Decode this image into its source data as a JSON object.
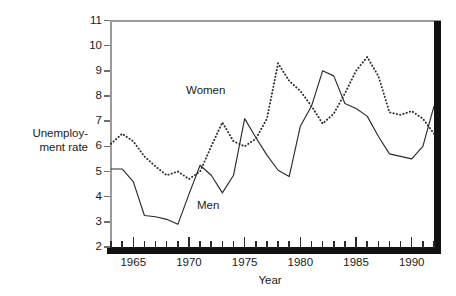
{
  "chart_data": {
    "type": "line",
    "title": "",
    "xlabel": "Year",
    "ylabel": "Unemployment rate",
    "ylabel_line1": "Unemploy-",
    "ylabel_line2": "ment rate",
    "xlim": [
      1963,
      1992
    ],
    "ylim": [
      2,
      11
    ],
    "ytick_labels": [
      "2",
      "3",
      "4",
      "5",
      "6",
      "7",
      "8",
      "9",
      "10",
      "11"
    ],
    "ytick_values": [
      2,
      3,
      4,
      5,
      6,
      7,
      8,
      9,
      10,
      11
    ],
    "xtick_labels": [
      "1965",
      "1970",
      "1975",
      "1980",
      "1985",
      "1990"
    ],
    "xtick_values": [
      1965,
      1970,
      1975,
      1980,
      1985,
      1990
    ],
    "xtick_minor_values": [
      1963,
      1964,
      1966,
      1967,
      1968,
      1969,
      1971,
      1972,
      1973,
      1974,
      1976,
      1977,
      1978,
      1979,
      1981,
      1982,
      1983,
      1984,
      1986,
      1987,
      1988,
      1989,
      1991,
      1992
    ],
    "grid": false,
    "legend_position": "inline-annotations",
    "x": [
      1963,
      1964,
      1965,
      1966,
      1967,
      1968,
      1969,
      1970,
      1971,
      1972,
      1973,
      1974,
      1975,
      1976,
      1977,
      1978,
      1979,
      1980,
      1981,
      1982,
      1983,
      1984,
      1985,
      1986,
      1987,
      1988,
      1989,
      1990,
      1991,
      1992
    ],
    "series": [
      {
        "name": "Men",
        "style": "solid",
        "color": "#2b2b2b",
        "values": [
          5.1,
          5.1,
          4.6,
          3.25,
          3.2,
          3.1,
          2.9,
          4.1,
          5.25,
          4.85,
          4.15,
          4.85,
          7.1,
          6.35,
          5.65,
          5.05,
          4.8,
          6.8,
          7.6,
          9.0,
          8.8,
          7.7,
          7.5,
          7.2,
          6.4,
          5.7,
          5.6,
          5.5,
          6.0,
          7.6
        ]
      },
      {
        "name": "Women",
        "style": "dotted",
        "color": "#2b2b2b",
        "values": [
          6.1,
          6.5,
          6.2,
          5.6,
          5.2,
          4.85,
          5.0,
          4.7,
          5.0,
          6.0,
          6.95,
          6.2,
          6.0,
          6.3,
          7.1,
          9.3,
          8.6,
          8.2,
          7.6,
          6.9,
          7.3,
          8.1,
          9.0,
          9.55,
          8.8,
          7.35,
          7.25,
          7.4,
          7.1,
          6.5
        ]
      }
    ],
    "annotations": [
      {
        "text": "Women",
        "x": 1972.2,
        "y": 8.4
      },
      {
        "text": "Men",
        "x": 1973.2,
        "y": 3.7
      }
    ]
  },
  "labels": {
    "series_women": "Women",
    "series_men": "Men",
    "x_axis": "Year",
    "y_axis_line1": "Unemploy-",
    "y_axis_line2": "ment rate"
  }
}
